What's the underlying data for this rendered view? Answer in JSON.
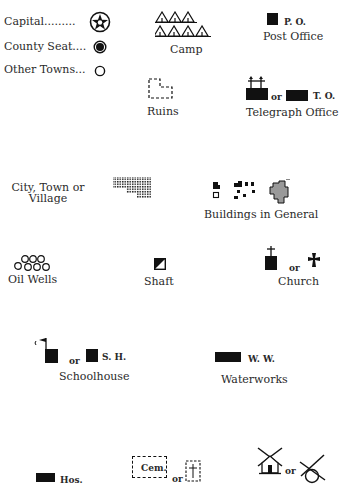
{
  "legend": {
    "towns": [
      {
        "label": "Capital.........",
        "icon": "star-in-circle-icon"
      },
      {
        "label": "County Seat....",
        "icon": "filled-dot-in-circle-icon"
      },
      {
        "label": "Other Towns...",
        "icon": "open-circle-icon"
      }
    ],
    "camp": {
      "label": "Camp",
      "icon": "tents-icon"
    },
    "post_office": {
      "abbr": "P. O.",
      "label": "Post Office",
      "icon": "black-square-icon"
    },
    "ruins": {
      "label": "Ruins",
      "icon": "dashed-outline-icon"
    },
    "telegraph_office": {
      "or": "or",
      "abbr": "T. O.",
      "label": "Telegraph Office",
      "icon": "building-with-poles-icon"
    },
    "city": {
      "label_line1": "City, Town or",
      "label_line2": "Village",
      "icon": "crosshatched-block-icon"
    },
    "buildings": {
      "label": "Buildings in General",
      "icon": "building-squares-icon"
    },
    "oil_wells": {
      "label": "Oil Wells",
      "icon": "circles-cluster-icon"
    },
    "shaft": {
      "label": "Shaft",
      "icon": "half-filled-square-icon"
    },
    "church": {
      "or": "or",
      "label": "Church",
      "icon": "cross-icon"
    },
    "schoolhouse": {
      "or": "or",
      "abbr": "S. H.",
      "label": "Schoolhouse",
      "icon": "flag-building-icon"
    },
    "waterworks": {
      "abbr": "W. W.",
      "label": "Waterworks",
      "icon": "black-rectangle-icon"
    },
    "hospital": {
      "abbr": "Hos.",
      "icon": "black-rectangle-icon"
    },
    "cemetery": {
      "abbr": "Cem.",
      "or": "or",
      "icon": "dashed-box-cross-icon"
    },
    "windmill": {
      "or": "or",
      "icon": "windmill-icon"
    }
  }
}
